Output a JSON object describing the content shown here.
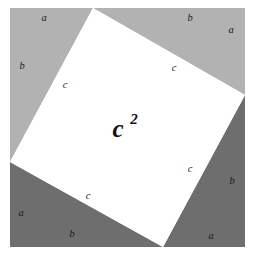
{
  "figure": {
    "background_color": "#ffffff",
    "canvas": {
      "width": 253,
      "height": 262
    }
  },
  "colors": {
    "light_gray": "#b2b2b2",
    "dark_gray": "#6e6e6e",
    "inner_square": "#ffffff",
    "label_color": "#1a1a1a",
    "outline": "#9a9a9a"
  },
  "outer_square": {
    "name": "outer-square",
    "left": 10,
    "top": 8,
    "right": 245,
    "bottom": 247
  },
  "inner_square": {
    "name": "inner-square-c-squared",
    "fill": "#ffffff",
    "vertices": [
      {
        "x": 93,
        "y": 8
      },
      {
        "x": 245,
        "y": 95
      },
      {
        "x": 163,
        "y": 247
      },
      {
        "x": 10,
        "y": 162
      }
    ],
    "area_label": "c",
    "area_exponent": "2"
  },
  "triangles": [
    {
      "name": "triangle-top-left",
      "shade": "light",
      "fill": "#b2b2b2",
      "points": "10,8 93,8 10,162"
    },
    {
      "name": "triangle-top-right",
      "shade": "light",
      "fill": "#b2b2b2",
      "points": "93,8 245,8 245,95"
    },
    {
      "name": "triangle-bottom-right",
      "shade": "dark",
      "fill": "#6e6e6e",
      "points": "245,95 245,247 163,247"
    },
    {
      "name": "triangle-bottom-left",
      "shade": "dark",
      "fill": "#6e6e6e",
      "points": "10,162 163,247 10,247"
    }
  ],
  "labels": [
    {
      "id": "a-top-left",
      "text": "a",
      "x": 44,
      "y": 19,
      "leg": "a"
    },
    {
      "id": "b-left-upper",
      "text": "b",
      "x": 22,
      "y": 67,
      "leg": "b"
    },
    {
      "id": "c-left-upper",
      "text": "c",
      "x": 65,
      "y": 86,
      "leg": "c"
    },
    {
      "id": "b-top-right",
      "text": "b",
      "x": 190,
      "y": 19,
      "leg": "b"
    },
    {
      "id": "a-right-upper",
      "text": "a",
      "x": 231,
      "y": 31,
      "leg": "a"
    },
    {
      "id": "c-right-upper",
      "text": "c",
      "x": 174,
      "y": 69,
      "leg": "c"
    },
    {
      "id": "c-right-lower",
      "text": "c",
      "x": 190,
      "y": 170,
      "leg": "c"
    },
    {
      "id": "b-right-lower",
      "text": "b",
      "x": 232,
      "y": 182,
      "leg": "b"
    },
    {
      "id": "a-bottom-right",
      "text": "a",
      "x": 211,
      "y": 237,
      "leg": "a"
    },
    {
      "id": "c-bottom-left",
      "text": "c",
      "x": 88,
      "y": 197,
      "leg": "c"
    },
    {
      "id": "a-bottom-left",
      "text": "a",
      "x": 21,
      "y": 214,
      "leg": "a"
    },
    {
      "id": "b-bottom",
      "text": "b",
      "x": 72,
      "y": 235,
      "leg": "b"
    }
  ],
  "center_label": {
    "base": "c",
    "exponent": "2",
    "base_x": 118,
    "base_y": 131,
    "exp_x": 134,
    "exp_y": 121
  }
}
